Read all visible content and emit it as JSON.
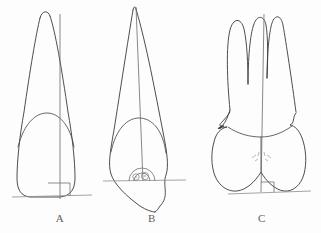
{
  "figure": {
    "background_color": "#fdfdfd",
    "line_color": "#3a3a3a",
    "axis_color": "#6b6b6b",
    "baseline_color": "#8d8d8d",
    "caption_color": "#5f5f5f",
    "panels": [
      {
        "id": "panel-a",
        "label": "A",
        "tooth": "maxillary central incisor",
        "root_apex": "rounded",
        "root_count": 1,
        "crown_shape": "rounded rectangular crown",
        "has_long_axis": true,
        "has_baseline": true,
        "angle_marker": "right-angle-square",
        "angle_marker_position": "base-center",
        "cervical_marks": "none",
        "label_x": 60,
        "label_y": 222
      },
      {
        "id": "panel-b",
        "label": "B",
        "tooth": "maxillary canine",
        "root_apex": "pointed",
        "root_count": 1,
        "crown_shape": "diamond / rhomboid crown",
        "has_long_axis": true,
        "has_baseline": true,
        "angle_marker": "protractor-arc",
        "angle_marker_position": "mid-crown",
        "cervical_marks": "two small circles",
        "label_x": 152,
        "label_y": 222
      },
      {
        "id": "panel-c",
        "label": "C",
        "tooth": "maxillary first molar",
        "root_apex": "three rounded roots",
        "root_count": 3,
        "crown_shape": "wide bilobed crown",
        "has_long_axis": true,
        "has_baseline": true,
        "angle_marker": "right-angle-square",
        "angle_marker_position": "base-right-of-axis",
        "cervical_marks": "dashed cross hatch",
        "label_x": 262,
        "label_y": 222
      }
    ]
  }
}
